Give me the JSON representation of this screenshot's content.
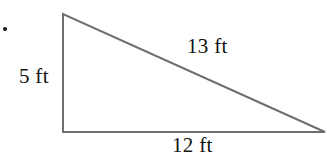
{
  "figure": {
    "kind": "right-triangle",
    "bullet": "•",
    "stroke_color": "#6e6e6e",
    "stroke_width": 2,
    "background_color": "#ffffff",
    "text_color": "#121212",
    "vertices": {
      "apex": {
        "x": 63,
        "y": 14
      },
      "right_angle": {
        "x": 63,
        "y": 132
      },
      "base_right": {
        "x": 325,
        "y": 132
      }
    },
    "labels": {
      "vertical_leg": "5 ft",
      "hypotenuse": "13 ft",
      "base": "12 ft"
    }
  },
  "chart_data": {
    "type": "diagram",
    "title": "",
    "shape": "right triangle",
    "sides": [
      {
        "name": "vertical leg",
        "label": "5 ft",
        "value": 5,
        "unit": "ft"
      },
      {
        "name": "base",
        "label": "12 ft",
        "value": 12,
        "unit": "ft"
      },
      {
        "name": "hypotenuse",
        "label": "13 ft",
        "value": 13,
        "unit": "ft"
      }
    ],
    "annotations": [
      "5 ft",
      "13 ft",
      "12 ft"
    ]
  }
}
